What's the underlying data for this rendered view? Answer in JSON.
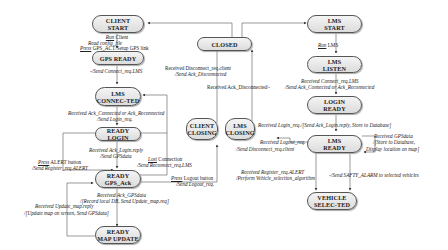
{
  "diagram": {
    "type": "state-machine",
    "states": {
      "client_start": "CLIENT\nSTART",
      "gps_ready": "GPS READY",
      "lms_connected": "LMS\nCONNEC-TED",
      "ready_login": "READY LOGIN",
      "ready_gps_ack": "READY\nGPS_Ack",
      "ready_map_update": "READY\nMAP UPDATE",
      "closed": "CLOSED",
      "client_closing": "CLIENT\nCLOSING",
      "lms_closing": "LMS\nCLOSING",
      "lms_start": "LMS\nSTART",
      "lms_listen": "LMS\nLISTEN",
      "login_ready": "LOGIN\nREADY",
      "lms_ready": "LMS\nREADY",
      "vehicle_selected": "VEHICLE\nSELEC-TED"
    },
    "transitions": {
      "t1_a": "Run",
      "t1_b": " Client",
      "t1_c": "Read config_file",
      "t1_d": "Press",
      "t1_e": " GPS_ACT/Setup GPS link",
      "t2": "-/Send Connect_req.LMS",
      "t3_a": "Received Ack_Connected or Ack_Reconnected",
      "t3_b": "/Send Login_req.",
      "t4_a": "Received Ack_Login.reply",
      "t4_b": "/Send GPSdata",
      "t5_a": "Press",
      "t5_b": " ALERT button",
      "t5_c": "/Send Register_req.ALERT",
      "t6_a": "Lost",
      "t6_b": " Connection",
      "t6_c": "/Send Reconnect_req.LMS",
      "t7_a": "Press",
      "t7_b": " Logout button",
      "t7_c": "/Send Logout_req.",
      "t8_a": "Received Ack_GPSdata",
      "t8_b": "/[Record local DB, Send Update_map.req]",
      "t9_a": "Received Update_map.reply",
      "t9_b": "/[Update map on screen, Send GPSdata]",
      "t10_a": "Received Disconnect_req.client",
      "t10_b": "/Send Ack_Disconnected",
      "t11": "Received Ack_Disconnected/-",
      "t12_a": "Run",
      "t12_b": " LMS",
      "t13_a": "Received Connect_req.LMS",
      "t13_b": "/Send Ack_Connected or Ack_Reconnected",
      "t14": "Received  Login_req./[Send Ack_Login.reply, Store to Database]",
      "t15_a": "Received GPSdata",
      "t15_b": "/[Store to Database,",
      "t15_c": "Display location on map]",
      "t16_a": "Received Logout_req.",
      "t16_b": "/Send Disconnect_req.client",
      "t17_a": "Received Register_req.ALERT",
      "t17_b": "/Perform Vehicle_selection_algorithm",
      "t18": "-/Send SAFTY_ALARM to selected vehicles"
    }
  }
}
